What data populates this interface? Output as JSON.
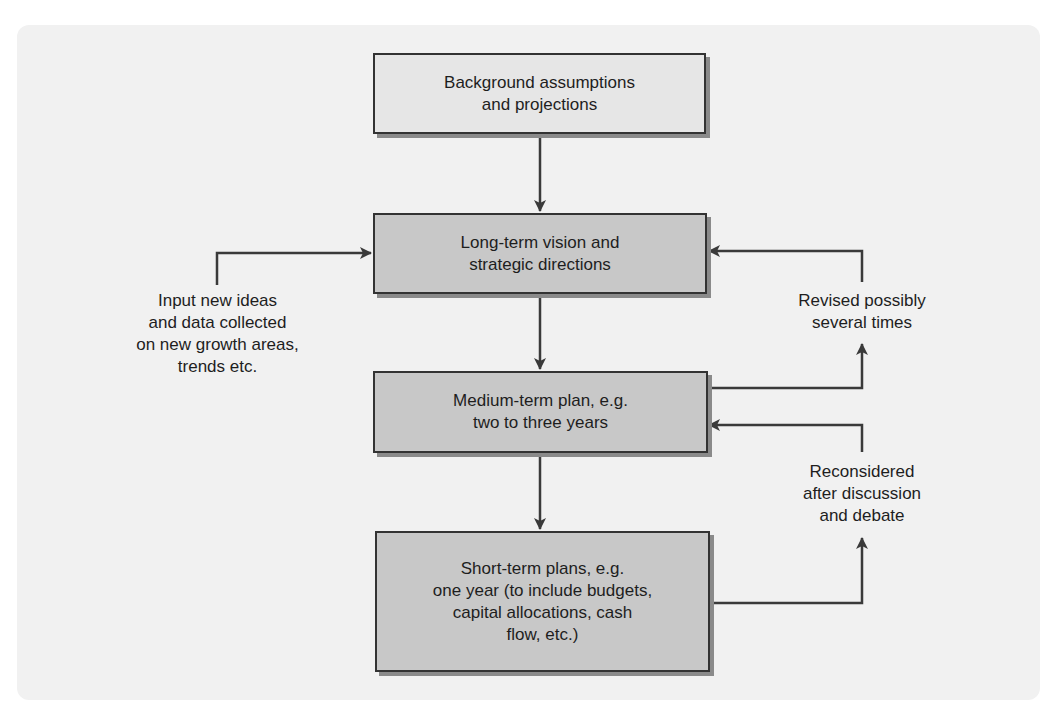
{
  "diagram": {
    "type": "flowchart",
    "boxes": [
      {
        "id": "background",
        "text": "Background assumptions\nand projections"
      },
      {
        "id": "long_term",
        "text": "Long-term vision and\nstrategic directions"
      },
      {
        "id": "medium_term",
        "text": "Medium-term plan, e.g.\ntwo to three years"
      },
      {
        "id": "short_term",
        "text": "Short-term plans, e.g.\none year (to include budgets,\ncapital allocations, cash\nflow, etc.)"
      }
    ],
    "annotations": [
      {
        "id": "input_ideas",
        "text": "Input new ideas\nand data collected\non new growth areas,\ntrends etc."
      },
      {
        "id": "revised",
        "text": "Revised possibly\nseveral times"
      },
      {
        "id": "reconsidered",
        "text": "Reconsidered\nafter discussion\nand debate"
      }
    ],
    "edges": [
      {
        "from": "background",
        "to": "long_term"
      },
      {
        "from": "long_term",
        "to": "medium_term"
      },
      {
        "from": "medium_term",
        "to": "short_term"
      },
      {
        "from": "input_ideas",
        "to": "long_term"
      },
      {
        "from": "medium_term",
        "to": "revised"
      },
      {
        "from": "revised",
        "to": "long_term"
      },
      {
        "from": "short_term",
        "to": "reconsidered"
      },
      {
        "from": "reconsidered",
        "to": "medium_term"
      }
    ],
    "colors": {
      "panel_bg": "#f1f1f1",
      "box_top_fill": "#e6e6e6",
      "box_fill": "#c8c8c8",
      "line": "#3a3a3a"
    }
  }
}
